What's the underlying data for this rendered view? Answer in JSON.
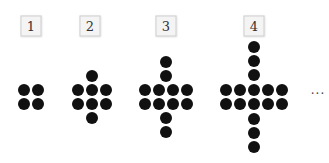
{
  "figures": [
    {
      "label": "1",
      "label_pos": [
        31,
        26
      ],
      "dot_count": 4,
      "dots": [
        [
          24,
          90
        ],
        [
          38,
          90
        ],
        [
          24,
          104
        ],
        [
          38,
          104
        ]
      ]
    },
    {
      "label": "2",
      "label_pos": [
        90,
        26
      ],
      "dot_count": 8,
      "dots": [
        [
          92,
          76
        ],
        [
          78,
          90
        ],
        [
          92,
          90
        ],
        [
          106,
          90
        ],
        [
          78,
          104
        ],
        [
          92,
          104
        ],
        [
          106,
          104
        ],
        [
          92,
          118
        ]
      ]
    },
    {
      "label": "3",
      "label_pos": [
        166,
        26
      ],
      "dot_count": 12,
      "dots": [
        [
          166,
          62
        ],
        [
          166,
          76
        ],
        [
          145,
          90
        ],
        [
          159,
          90
        ],
        [
          173,
          90
        ],
        [
          187,
          90
        ],
        [
          145,
          104
        ],
        [
          159,
          104
        ],
        [
          173,
          104
        ],
        [
          187,
          104
        ],
        [
          166,
          118
        ],
        [
          166,
          132
        ]
      ]
    },
    {
      "label": "4",
      "label_pos": [
        254,
        26
      ],
      "dot_count": 16,
      "dots": [
        [
          254,
          47
        ],
        [
          254,
          61
        ],
        [
          254,
          75
        ],
        [
          226,
          90
        ],
        [
          240,
          90
        ],
        [
          254,
          90
        ],
        [
          268,
          90
        ],
        [
          282,
          90
        ],
        [
          226,
          104
        ],
        [
          240,
          104
        ],
        [
          254,
          104
        ],
        [
          268,
          104
        ],
        [
          282,
          104
        ],
        [
          254,
          119
        ],
        [
          254,
          133
        ],
        [
          254,
          147
        ]
      ]
    }
  ],
  "continuation": {
    "text": "···",
    "pos": [
      318,
      94
    ]
  },
  "colors": {
    "dot": "#111111",
    "label_border": "#cfcfcf",
    "label_bg": "#f4f4f4"
  }
}
